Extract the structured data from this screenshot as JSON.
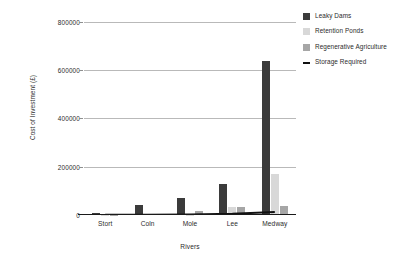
{
  "chart_data": {
    "type": "bar",
    "title": "",
    "subtitle": "",
    "xlabel": "Rivers",
    "ylabel": "Cost of Investment (£)",
    "categories": [
      "Stort",
      "Coln",
      "Mole",
      "Lee",
      "Medway"
    ],
    "ylim": [
      0,
      800000
    ],
    "ytick_labels": [
      "0",
      "200000",
      "400000",
      "600000",
      "800000"
    ],
    "ytick_values": [
      0,
      200000,
      400000,
      600000,
      800000
    ],
    "grid": true,
    "legend_position": "right",
    "series": [
      {
        "name": "Leaky Dams",
        "kind": "bar",
        "color": "#3b3b3b",
        "values": [
          10000,
          42000,
          70000,
          130000,
          640000
        ]
      },
      {
        "name": "Retention Ponds",
        "kind": "bar",
        "color": "#d8d8d8",
        "values": [
          1000,
          5000,
          2000,
          33000,
          170000
        ]
      },
      {
        "name": "Regenerative Agriculture",
        "kind": "bar",
        "color": "#a6a6a6",
        "values": [
          1500,
          3000,
          18000,
          35000,
          38000
        ]
      },
      {
        "name": "Storage Required",
        "kind": "line",
        "color": "#111111",
        "values": [
          1000,
          1500,
          2500,
          5000,
          12000
        ]
      }
    ]
  },
  "axes": {
    "y_title": "Cost of Investment (£)",
    "x_title": "Rivers",
    "y_ticks": [
      {
        "label": "800000",
        "value": 800000
      },
      {
        "label": "600000",
        "value": 600000
      },
      {
        "label": "400000",
        "value": 400000
      },
      {
        "label": "200000",
        "value": 200000
      },
      {
        "label": "0",
        "value": 0
      }
    ],
    "x_ticks": [
      "Stort",
      "Coln",
      "Mole",
      "Lee",
      "Medway"
    ]
  },
  "legend": {
    "items": [
      {
        "label": "Leaky Dams",
        "color": "#3b3b3b",
        "marker": "square-swatch-icon"
      },
      {
        "label": "Retention Ponds",
        "color": "#d8d8d8",
        "marker": "square-swatch-icon"
      },
      {
        "label": "Regenerative Agriculture",
        "color": "#a6a6a6",
        "marker": "square-swatch-icon"
      },
      {
        "label": "Storage Required",
        "color": "#111111",
        "marker": "line-swatch-icon"
      }
    ]
  },
  "colors": {
    "background": "#ffffff",
    "gridline": "#b9b9b9",
    "axis": "#1a1a1a",
    "text": "#2b2b2b"
  }
}
